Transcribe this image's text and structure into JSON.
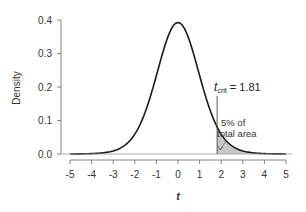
{
  "chart_data": {
    "type": "line",
    "title": "",
    "xlabel": "t",
    "ylabel": "Density",
    "xlim": [
      -5,
      5
    ],
    "ylim": [
      0,
      0.4
    ],
    "x_ticks": [
      "-5",
      "-4",
      "-3",
      "-2",
      "-1",
      "0",
      "1",
      "2",
      "3",
      "4",
      "5"
    ],
    "y_ticks": [
      "0.0",
      "0.1",
      "0.2",
      "0.3",
      "0.4"
    ],
    "grid": false,
    "legend": null,
    "series": [
      {
        "name": "t-distribution density",
        "x": [
          -5,
          -4.5,
          -4,
          -3.5,
          -3,
          -2.5,
          -2,
          -1.5,
          -1,
          -0.5,
          0,
          0.5,
          1,
          1.5,
          2,
          2.5,
          3,
          3.5,
          4,
          4.5,
          5
        ],
        "values": [
          0.001,
          0.002,
          0.004,
          0.008,
          0.016,
          0.032,
          0.062,
          0.121,
          0.229,
          0.342,
          0.388,
          0.342,
          0.229,
          0.121,
          0.062,
          0.032,
          0.016,
          0.008,
          0.004,
          0.002,
          0.001
        ]
      }
    ],
    "shaded_region": {
      "from": 1.81,
      "to": 5,
      "fill": "#c8c8c8"
    },
    "annotations": [
      {
        "text_main": "t",
        "text_sub": "crit",
        "text_rest": " = 1.81",
        "x": 1.81
      },
      {
        "line1": "5% of",
        "line2": "total area"
      }
    ]
  },
  "colors": {
    "curve": "#1a1a1a",
    "axis": "#666666",
    "shade": "#c8c8c8",
    "text": "#333333"
  }
}
